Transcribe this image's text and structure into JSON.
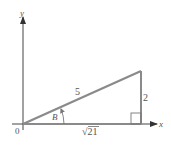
{
  "diagram": {
    "type": "right-triangle-on-axes",
    "axes": {
      "x_label": "x",
      "y_label": "y",
      "origin_label": "0"
    },
    "triangle": {
      "hypotenuse_label": "5",
      "opposite_label": "2",
      "adjacent_label": "√21",
      "angle_label": "B",
      "right_angle_marker": true
    },
    "colors": {
      "triangle": "#8a8a8a",
      "axes": "#444444",
      "text": "#555555"
    }
  }
}
